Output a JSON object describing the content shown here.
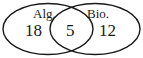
{
  "venn": {
    "sets": [
      {
        "name": "Alg.",
        "only_count": "18"
      },
      {
        "name": "Bio.",
        "only_count": "12"
      }
    ],
    "intersection_count": "5",
    "stroke_color": "#1a1a1a"
  }
}
